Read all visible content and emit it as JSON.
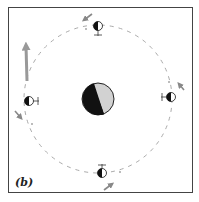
{
  "figure": {
    "panel_label": "(b)",
    "colors": {
      "frame": "#444444",
      "orbit": "#999999",
      "arrow": "#888888",
      "body_dark": "#111111",
      "body_light": "#d0d0d0",
      "large_arrow": "#999999"
    },
    "central_body": {
      "x": 98,
      "y": 99,
      "r": 16,
      "phase": "half-lit"
    },
    "orbit": {
      "cx": 98,
      "cy": 99,
      "r": 74,
      "style": "dashed"
    },
    "satellites": [
      {
        "position": "top",
        "x": 98,
        "y": 28
      },
      {
        "position": "left",
        "x": 29,
        "y": 101
      },
      {
        "position": "right",
        "x": 171,
        "y": 97
      },
      {
        "position": "bottom",
        "x": 102,
        "y": 171
      }
    ],
    "motion_arrows": [
      {
        "position": "top",
        "direction": "down-left"
      },
      {
        "position": "left",
        "direction": "down-right"
      },
      {
        "position": "right",
        "direction": "up-left"
      },
      {
        "position": "bottom",
        "direction": "up-right"
      }
    ],
    "large_arrow": {
      "direction": "up",
      "x": 26,
      "y1": 80,
      "y2": 40
    }
  }
}
